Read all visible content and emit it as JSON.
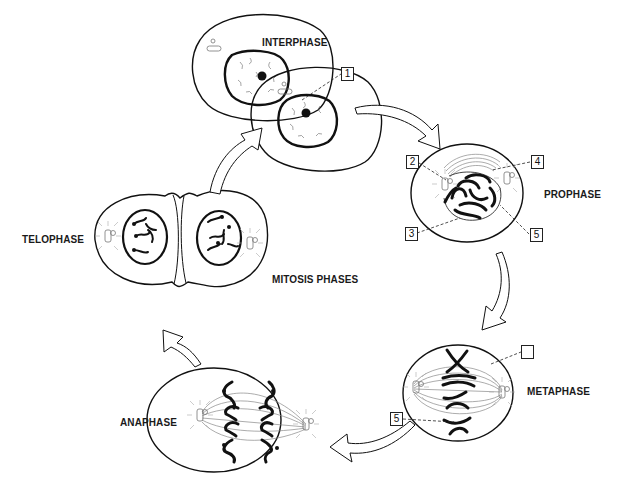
{
  "diagram": {
    "title": "MITOSIS PHASES",
    "phases": [
      {
        "id": "interphase",
        "label": "INTERPHASE"
      },
      {
        "id": "prophase",
        "label": "PROPHASE"
      },
      {
        "id": "metaphase",
        "label": "METAPHASE"
      },
      {
        "id": "anaphase",
        "label": "ANAPHASE"
      },
      {
        "id": "telophase",
        "label": "TELOPHASE"
      }
    ],
    "callouts": [
      {
        "number": "1",
        "phase": "interphase"
      },
      {
        "number": "2",
        "phase": "prophase"
      },
      {
        "number": "3",
        "phase": "prophase"
      },
      {
        "number": "4",
        "phase": "prophase"
      },
      {
        "number": "5",
        "phase": "prophase"
      },
      {
        "number": "",
        "phase": "metaphase"
      },
      {
        "number": "5",
        "phase": "metaphase"
      }
    ],
    "cycle_order": [
      "INTERPHASE",
      "PROPHASE",
      "METAPHASE",
      "ANAPHASE",
      "TELOPHASE"
    ],
    "colors": {
      "line": "#111111",
      "spindle": "#888888",
      "background": "#ffffff"
    }
  }
}
